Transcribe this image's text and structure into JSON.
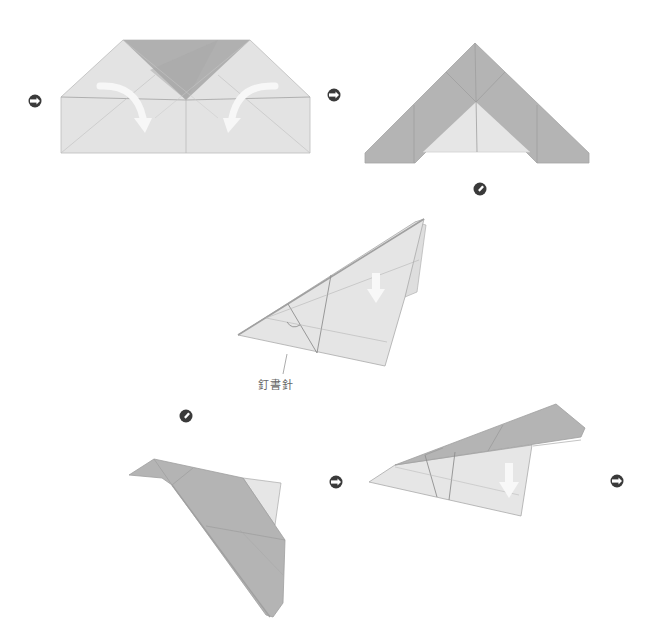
{
  "diagram": {
    "type": "origami-instructions",
    "colors": {
      "paper_light": "#e3e3e3",
      "paper_dark": "#b4b4b4",
      "paper_darker": "#a9a9a9",
      "crease": "#9a9a9a",
      "arrow_fill": "#f7f7f7",
      "icon": "#3a3a3a"
    },
    "steps": [
      {
        "id": 1,
        "description": "Rectangle with top triangle folded down; fold top corners toward center",
        "arrows": [
          "curved-fold-left",
          "curved-fold-right"
        ]
      },
      {
        "id": 2,
        "description": "Triangle shape with side flaps folded to center"
      },
      {
        "id": 3,
        "description": "Folded in half, turned sideways; fold wing down",
        "arrows": [
          "down-arrow"
        ],
        "callout": "staple"
      },
      {
        "id": 4,
        "description": "Wing folded down, second side shown",
        "arrows": [
          "down-arrow"
        ]
      },
      {
        "id": 5,
        "description": "Finished wing fold, rotated view"
      }
    ],
    "icons": [
      {
        "name": "turn-over-icon",
        "x": 35,
        "y": 101
      },
      {
        "name": "turn-over-icon",
        "x": 334,
        "y": 95
      },
      {
        "name": "rotate-icon",
        "x": 480,
        "y": 189
      },
      {
        "name": "rotate-icon",
        "x": 186,
        "y": 416
      },
      {
        "name": "turn-over-icon",
        "x": 336,
        "y": 482
      },
      {
        "name": "turn-over-icon",
        "x": 617,
        "y": 481
      }
    ],
    "callout": {
      "label": "釘書針"
    }
  }
}
